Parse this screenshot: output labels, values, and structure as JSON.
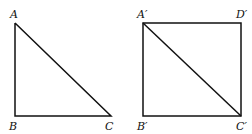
{
  "figures": [
    {
      "name": "triangle",
      "labels": {
        "A": "A",
        "B": "B",
        "C": "C"
      }
    },
    {
      "name": "square",
      "labels": {
        "A": "A′",
        "B": "B′",
        "C": "C′",
        "D": "D′"
      }
    }
  ]
}
